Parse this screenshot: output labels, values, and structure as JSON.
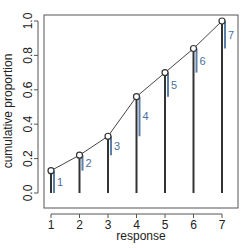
{
  "chart_data": {
    "type": "line",
    "title": "",
    "xlabel": "response",
    "ylabel": "cumulative proportion",
    "x": [
      1,
      2,
      3,
      4,
      5,
      6,
      7
    ],
    "values": [
      0.13,
      0.22,
      0.33,
      0.56,
      0.7,
      0.84,
      1.0
    ],
    "point_labels": [
      "1",
      "2",
      "3",
      "4",
      "5",
      "6",
      "7"
    ],
    "xticks": [
      "1",
      "2",
      "3",
      "4",
      "5",
      "6",
      "7"
    ],
    "yticks": [
      "0.0",
      "0.2",
      "0.4",
      "0.6",
      "0.8",
      "1.0"
    ],
    "xlim": [
      0.8,
      7.3
    ],
    "ylim": [
      0,
      1.05
    ],
    "grid": false,
    "legend": null,
    "colors": {
      "line": "#444444",
      "increment": "#5b7fa8",
      "label": "#4a6fa0"
    }
  }
}
